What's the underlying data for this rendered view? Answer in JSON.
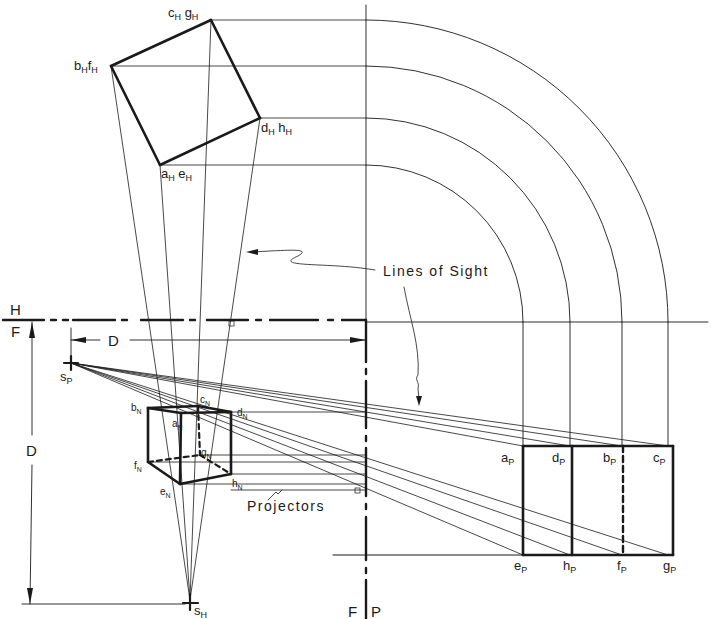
{
  "diagram": {
    "type": "perspective projection construction (plan and elevation method)",
    "plan_view_points": [
      {
        "id": "cg_H",
        "main": "c",
        "sub": "H",
        "main2": "g",
        "sub2": "H"
      },
      {
        "id": "bf_H",
        "main": "b",
        "sub": "H",
        "main2": "f",
        "sub2": "H"
      },
      {
        "id": "dh_H",
        "main": "d",
        "sub": "H",
        "main2": "h",
        "sub2": "H"
      },
      {
        "id": "ae_H",
        "main": "a",
        "sub": "H",
        "main2": "e",
        "sub2": "H"
      }
    ],
    "elevation_points": [
      {
        "main": "b",
        "sub": "N"
      },
      {
        "main": "c",
        "sub": "N"
      },
      {
        "main": "d",
        "sub": "N"
      },
      {
        "main": "a",
        "sub": "N"
      },
      {
        "main": "g",
        "sub": "N"
      },
      {
        "main": "f",
        "sub": "N"
      },
      {
        "main": "e",
        "sub": "N"
      },
      {
        "main": "h",
        "sub": "N"
      }
    ],
    "picture_plane_top": [
      {
        "main": "a",
        "sub": "P"
      },
      {
        "main": "d",
        "sub": "P"
      },
      {
        "main": "b",
        "sub": "P"
      },
      {
        "main": "c",
        "sub": "P"
      }
    ],
    "picture_plane_bottom": [
      {
        "main": "e",
        "sub": "P"
      },
      {
        "main": "h",
        "sub": "P"
      },
      {
        "main": "f",
        "sub": "P"
      },
      {
        "main": "g",
        "sub": "P"
      }
    ],
    "station_points": {
      "profile": {
        "main": "s",
        "sub": "P"
      },
      "plan": {
        "main": "s",
        "sub": "H"
      }
    },
    "fold_lines": {
      "hf_top": "H",
      "hf_bottom": "F",
      "fp_left": "F",
      "fp_right": "P"
    },
    "dimensions": {
      "horizontal": "D",
      "vertical": "D"
    },
    "annotations": {
      "lines_of_sight": "Lines of Sight",
      "projectors": "Projectors"
    }
  }
}
